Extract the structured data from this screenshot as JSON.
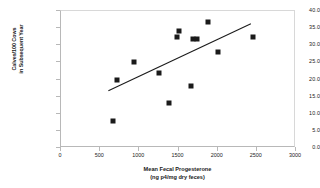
{
  "chart_data": {
    "type": "scatter",
    "title": "",
    "xlabel": "Mean Fecal Progesterone",
    "xlabel_units": "(ng p4/mg dry feces)",
    "ylabel_line1": "Calves/100 Cows",
    "ylabel_line2": "in Subsequent Year",
    "xlim": [
      0,
      3000
    ],
    "ylim": [
      0,
      40
    ],
    "xticks": [
      0,
      500,
      1000,
      1500,
      2000,
      2500,
      3000
    ],
    "xtick_labels": [
      "0",
      "500",
      "1000",
      "1500",
      "2000",
      "2500",
      "3000"
    ],
    "yticks": [
      0,
      5,
      10,
      15,
      20,
      25,
      30,
      35,
      40
    ],
    "ytick_labels": [
      "0.0",
      "5.0",
      "10.0",
      "15.0",
      "20.0",
      "25.0",
      "30.0",
      "35.0",
      "40.0"
    ],
    "grid": false,
    "legend": false,
    "marker": "filled-square",
    "marker_color": "#1a1a1a",
    "points": [
      {
        "x": 670,
        "y": 8.0
      },
      {
        "x": 720,
        "y": 20.0
      },
      {
        "x": 930,
        "y": 25.0
      },
      {
        "x": 1250,
        "y": 22.0
      },
      {
        "x": 1380,
        "y": 13.2
      },
      {
        "x": 1475,
        "y": 32.4
      },
      {
        "x": 1500,
        "y": 34.3
      },
      {
        "x": 1660,
        "y": 18.0
      },
      {
        "x": 1690,
        "y": 31.9
      },
      {
        "x": 1730,
        "y": 31.8
      },
      {
        "x": 1880,
        "y": 36.9
      },
      {
        "x": 2000,
        "y": 28.0
      },
      {
        "x": 2450,
        "y": 32.4
      }
    ],
    "trendline": {
      "type": "linear",
      "x_start": 610,
      "y_start": 16.4,
      "x_end": 2445,
      "y_end": 36.2,
      "color": "#1a1a1a"
    }
  }
}
